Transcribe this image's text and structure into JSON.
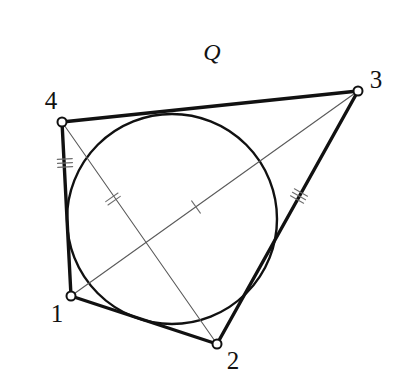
{
  "figure": {
    "title_label": "Q",
    "caption": "Quadrilateral 1-2-3-4 with inscribed circle and two diagonals",
    "canvas": {
      "width": 398,
      "height": 384,
      "background": "#ffffff"
    },
    "colors": {
      "stroke_heavy": "#111111",
      "stroke_light": "#5a5a5a",
      "tick": "#6e6e6e",
      "vertex_fill": "#ffffff",
      "label": "#111111"
    }
  },
  "shape_label": {
    "text": "Q",
    "x": 212,
    "y": 52
  },
  "vertices": [
    {
      "id": "1",
      "label": "1",
      "x": 71,
      "y": 296,
      "label_x": 57,
      "label_y": 313,
      "marker_r": 4.5
    },
    {
      "id": "2",
      "label": "2",
      "x": 217,
      "y": 344,
      "label_x": 233,
      "label_y": 360,
      "marker_r": 4.5
    },
    {
      "id": "3",
      "label": "3",
      "x": 358,
      "y": 91,
      "label_x": 376,
      "label_y": 79,
      "marker_r": 4.5
    },
    {
      "id": "4",
      "label": "4",
      "x": 62,
      "y": 122,
      "label_x": 51,
      "label_y": 100,
      "marker_r": 4.5
    }
  ],
  "sides": [
    {
      "name": "side-4-3",
      "from": "4",
      "to": "3",
      "x1": 62,
      "y1": 122,
      "x2": 358,
      "y2": 91,
      "width": 3.4,
      "ticks": 0
    },
    {
      "name": "side-3-2",
      "from": "3",
      "to": "2",
      "x1": 358,
      "y1": 91,
      "x2": 217,
      "y2": 344,
      "width": 3.4,
      "ticks": 3,
      "tick_x": 299,
      "tick_y": 196
    },
    {
      "name": "side-2-1",
      "from": "2",
      "to": "1",
      "x1": 217,
      "y1": 344,
      "x2": 71,
      "y2": 296,
      "width": 3.4,
      "ticks": 0
    },
    {
      "name": "side-1-4",
      "from": "1",
      "to": "4",
      "x1": 71,
      "y1": 296,
      "x2": 62,
      "y2": 122,
      "width": 3.4,
      "ticks": 3,
      "tick_x": 65,
      "tick_y": 163
    }
  ],
  "diagonals": [
    {
      "name": "diagonal-1-3",
      "from": "1",
      "to": "3",
      "x1": 71,
      "y1": 296,
      "x2": 358,
      "y2": 91,
      "width": 1.1,
      "ticks": 1,
      "tick_x": 196,
      "tick_y": 207
    },
    {
      "name": "diagonal-4-2",
      "from": "4",
      "to": "2",
      "x1": 62,
      "y1": 122,
      "x2": 217,
      "y2": 344,
      "width": 1.1,
      "ticks": 2,
      "tick_x": 113,
      "tick_y": 199
    }
  ],
  "inscribed_circle": {
    "name": "inscribed-circle",
    "cx": 172,
    "cy": 219,
    "r": 105,
    "width": 2.4
  },
  "tick_style": {
    "length": 15,
    "spacing": 4,
    "width": 1.1
  }
}
